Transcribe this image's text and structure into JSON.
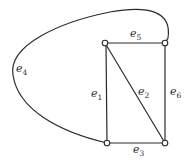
{
  "diagram": {
    "type": "graph",
    "vertices": [
      {
        "id": "v1",
        "x": 105,
        "y": 43
      },
      {
        "id": "v2",
        "x": 165,
        "y": 43
      },
      {
        "id": "v3",
        "x": 107,
        "y": 143
      },
      {
        "id": "v4",
        "x": 165,
        "y": 143
      }
    ],
    "edges": [
      {
        "id": "e1",
        "base": "e",
        "sub": "1",
        "from": "v1",
        "to": "v3",
        "label_x": 93,
        "label_y": 97
      },
      {
        "id": "e2",
        "base": "e",
        "sub": "2",
        "from": "v1",
        "to": "v4",
        "label_x": 139,
        "label_y": 97
      },
      {
        "id": "e3",
        "base": "e",
        "sub": "3",
        "from": "v3",
        "to": "v4",
        "label_x": 134,
        "label_y": 154
      },
      {
        "id": "e4",
        "base": "e",
        "sub": "4",
        "from": "v3",
        "to": "v2",
        "curved": true,
        "label_x": 16,
        "label_y": 74
      },
      {
        "id": "e5",
        "base": "e",
        "sub": "5",
        "from": "v1",
        "to": "v2",
        "label_x": 131,
        "label_y": 38
      },
      {
        "id": "e6",
        "base": "e",
        "sub": "6",
        "from": "v2",
        "to": "v4",
        "label_x": 170,
        "label_y": 97
      }
    ]
  }
}
